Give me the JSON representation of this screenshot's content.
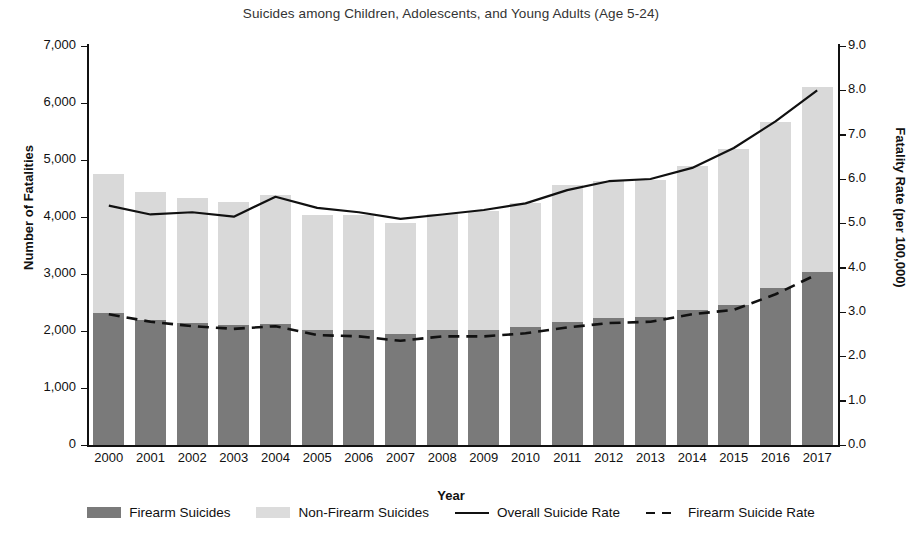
{
  "chart_data": {
    "type": "bar",
    "title": "Suicides among Children, Adolescents, and Young Adults (Age 5-24)",
    "xlabel": "Year",
    "ylabel": "Number of Fatalities",
    "ylabel_right": "Fatality Rate (per 100,000)",
    "grid": false,
    "legend_position": "bottom",
    "categories": [
      "2000",
      "2001",
      "2002",
      "2003",
      "2004",
      "2005",
      "2006",
      "2007",
      "2008",
      "2009",
      "2010",
      "2011",
      "2012",
      "2013",
      "2014",
      "2015",
      "2016",
      "2017"
    ],
    "ylim": [
      0,
      7000
    ],
    "ylim_right": [
      0,
      9.0
    ],
    "yticks": [
      "0",
      "1,000",
      "2,000",
      "3,000",
      "4,000",
      "5,000",
      "6,000",
      "7,000"
    ],
    "ytick_values": [
      0,
      1000,
      2000,
      3000,
      4000,
      5000,
      6000,
      7000
    ],
    "yticks_right": [
      "0.0",
      "1.0",
      "2.0",
      "3.0",
      "4.0",
      "5.0",
      "6.0",
      "7.0",
      "8.0",
      "9.0"
    ],
    "ytick_values_right": [
      0.0,
      1.0,
      2.0,
      3.0,
      4.0,
      5.0,
      6.0,
      7.0,
      8.0,
      9.0
    ],
    "series": [
      {
        "name": "Firearm Suicides",
        "type": "bar-stack",
        "axis": "left",
        "color": "#7a7a7a",
        "values": [
          2320,
          2200,
          2140,
          2105,
          2125,
          2020,
          2020,
          1950,
          2020,
          2020,
          2070,
          2160,
          2230,
          2245,
          2370,
          2460,
          2755,
          3035
        ]
      },
      {
        "name": "Non-Firearm Suicides",
        "type": "bar-stack",
        "axis": "left",
        "color": "#d9d9d9",
        "values": [
          2430,
          2230,
          2200,
          2155,
          2255,
          2020,
          2020,
          1950,
          2035,
          2090,
          2180,
          2400,
          2400,
          2400,
          2530,
          2740,
          2910,
          3240
        ]
      },
      {
        "name": "Overall Suicide Rate",
        "type": "line",
        "axis": "right",
        "style": "solid",
        "color": "#111111",
        "values": [
          5.4,
          5.2,
          5.25,
          5.15,
          5.6,
          5.35,
          5.25,
          5.1,
          5.2,
          5.3,
          5.45,
          5.75,
          5.95,
          6.0,
          6.25,
          6.7,
          7.3,
          8.0
        ]
      },
      {
        "name": "Firearm Suicide Rate",
        "type": "line",
        "axis": "right",
        "style": "dashed",
        "color": "#111111",
        "values": [
          2.95,
          2.78,
          2.68,
          2.62,
          2.68,
          2.48,
          2.45,
          2.35,
          2.45,
          2.45,
          2.52,
          2.65,
          2.75,
          2.78,
          2.95,
          3.05,
          3.4,
          3.85
        ]
      }
    ],
    "legend": [
      {
        "label": "Firearm Suicides",
        "marker": "swatch-dark"
      },
      {
        "label": "Non-Firearm Suicides",
        "marker": "swatch-light"
      },
      {
        "label": "Overall Suicide Rate",
        "marker": "line-solid"
      },
      {
        "label": "Firearm Suicide Rate",
        "marker": "line-dashed"
      }
    ]
  }
}
